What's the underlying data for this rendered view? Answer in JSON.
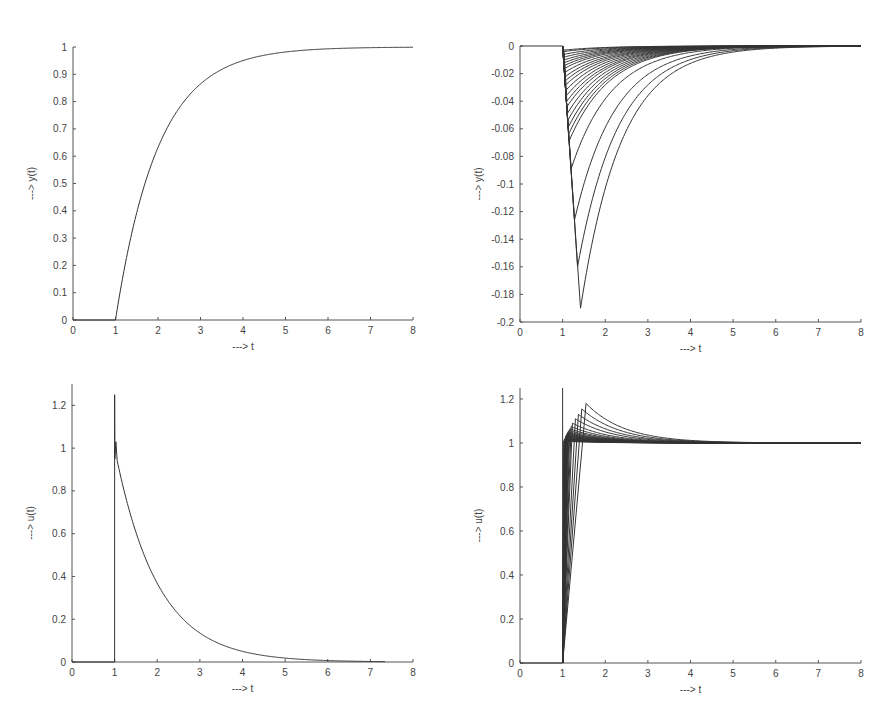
{
  "figure": {
    "layout": "2x2 subplots",
    "background": "#ffffff",
    "line_color": "#333333"
  },
  "chart_data": [
    {
      "id": "top-left",
      "type": "line",
      "title": "",
      "xlabel": "---> t",
      "ylabel": "---> y(t)",
      "xlim": [
        0,
        8
      ],
      "ylim": [
        0,
        1
      ],
      "xticks": [
        "0",
        "1",
        "2",
        "3",
        "4",
        "5",
        "6",
        "7",
        "8"
      ],
      "yticks": [
        "0",
        "0.1",
        "0.2",
        "0.3",
        "0.4",
        "0.5",
        "0.6",
        "0.7",
        "0.8",
        "0.9",
        "1"
      ],
      "grid": false,
      "legend": null,
      "pixel_box": {
        "x0": 73,
        "x1": 413,
        "y_top": 47,
        "y_bottom": 320
      },
      "model": {
        "kind": "step",
        "delay": 1,
        "tau": 1,
        "gain": 1
      },
      "series": [
        {
          "name": "y(t)",
          "x": [
            0,
            1,
            1.5,
            2,
            2.5,
            3,
            4,
            5,
            6,
            7,
            8
          ],
          "values": [
            0,
            0,
            0.39,
            0.63,
            0.78,
            0.86,
            0.95,
            0.98,
            0.99,
            1.0,
            1.0
          ]
        }
      ]
    },
    {
      "id": "top-right",
      "type": "line",
      "title": "",
      "xlabel": "---> t",
      "ylabel": "---> y(t)",
      "xlim": [
        0,
        8
      ],
      "ylim": [
        -0.2,
        0
      ],
      "xticks": [
        "0",
        "1",
        "2",
        "3",
        "4",
        "5",
        "6",
        "7",
        "8"
      ],
      "yticks": [
        "-0.2",
        "-0.18",
        "-0.16",
        "-0.14",
        "-0.12",
        "-0.1",
        "-0.08",
        "-0.06",
        "-0.04",
        "-0.02",
        "0"
      ],
      "grid": false,
      "legend": null,
      "pixel_box": {
        "x0": 520,
        "x1": 861,
        "y_top": 46,
        "y_bottom": 322
      },
      "model": {
        "kind": "undershoot-family",
        "delay": 1,
        "tau": 1
      },
      "series_summary": "Family of ~25 curves; each drops from 0 at t=1 to a minimum near t=1.05-1.42, then decays back to 0 by t≈7",
      "series": [
        {
          "name": "curve-1",
          "peak_t": 1.42,
          "peak_y": -0.19
        },
        {
          "name": "curve-2",
          "peak_t": 1.35,
          "peak_y": -0.16
        },
        {
          "name": "curve-3",
          "peak_t": 1.28,
          "peak_y": -0.126
        },
        {
          "name": "curve-4",
          "peak_t": 1.2,
          "peak_y": -0.089
        },
        {
          "name": "curve-5",
          "peak_t": 1.15,
          "peak_y": -0.069
        },
        {
          "name": "curve-6",
          "peak_t": 1.14,
          "peak_y": -0.064
        },
        {
          "name": "curve-7",
          "peak_t": 1.13,
          "peak_y": -0.059
        },
        {
          "name": "curve-8",
          "peak_t": 1.12,
          "peak_y": -0.054
        },
        {
          "name": "curve-9",
          "peak_t": 1.11,
          "peak_y": -0.049
        },
        {
          "name": "curve-10",
          "peak_t": 1.1,
          "peak_y": -0.044
        },
        {
          "name": "curve-11",
          "peak_t": 1.1,
          "peak_y": -0.04
        },
        {
          "name": "curve-12",
          "peak_t": 1.09,
          "peak_y": -0.036
        },
        {
          "name": "curve-13",
          "peak_t": 1.08,
          "peak_y": -0.032
        },
        {
          "name": "curve-14",
          "peak_t": 1.08,
          "peak_y": -0.028
        },
        {
          "name": "curve-15",
          "peak_t": 1.07,
          "peak_y": -0.025
        },
        {
          "name": "curve-16",
          "peak_t": 1.07,
          "peak_y": -0.022
        },
        {
          "name": "curve-17",
          "peak_t": 1.06,
          "peak_y": -0.019
        },
        {
          "name": "curve-18",
          "peak_t": 1.06,
          "peak_y": -0.016
        },
        {
          "name": "curve-19",
          "peak_t": 1.05,
          "peak_y": -0.014
        },
        {
          "name": "curve-20",
          "peak_t": 1.05,
          "peak_y": -0.012
        },
        {
          "name": "curve-21",
          "peak_t": 1.05,
          "peak_y": -0.01
        },
        {
          "name": "curve-22",
          "peak_t": 1.04,
          "peak_y": -0.008
        },
        {
          "name": "curve-23",
          "peak_t": 1.04,
          "peak_y": -0.006
        },
        {
          "name": "curve-24",
          "peak_t": 1.03,
          "peak_y": -0.004
        },
        {
          "name": "curve-25",
          "peak_t": 1.03,
          "peak_y": -0.003
        }
      ]
    },
    {
      "id": "bottom-left",
      "type": "line",
      "title": "",
      "xlabel": "---> t",
      "ylabel": "---> u(t)",
      "xlim": [
        0,
        8
      ],
      "ylim": [
        0,
        1.3
      ],
      "xticks": [
        "0",
        "1",
        "2",
        "3",
        "4",
        "5",
        "6",
        "7",
        "8"
      ],
      "yticks": [
        "0",
        "0.2",
        "0.4",
        "0.6",
        "0.8",
        "1",
        "1.2"
      ],
      "grid": false,
      "legend": null,
      "pixel_box": {
        "x0": 72,
        "x1": 413,
        "y_zero": 662,
        "y_one": 449
      },
      "model": {
        "kind": "decay",
        "delay": 1,
        "tau": 1,
        "spike": 1.25
      },
      "series": [
        {
          "name": "u(t)",
          "x": [
            0,
            1,
            1,
            1.05,
            1.5,
            2,
            2.5,
            3,
            4,
            5,
            6,
            7.3
          ],
          "values": [
            0,
            0,
            1.25,
            0.97,
            0.6,
            0.37,
            0.22,
            0.135,
            0.05,
            0.018,
            0.007,
            0.0
          ]
        }
      ]
    },
    {
      "id": "bottom-right",
      "type": "line",
      "title": "",
      "xlabel": "---> t",
      "ylabel": "---> u(t)",
      "xlim": [
        0,
        8
      ],
      "ylim": [
        0,
        1.25
      ],
      "xticks": [
        "0",
        "1",
        "2",
        "3",
        "4",
        "5",
        "6",
        "7",
        "8"
      ],
      "yticks": [
        "0",
        "0.2",
        "0.4",
        "0.6",
        "0.8",
        "1",
        "1.2"
      ],
      "grid": false,
      "legend": null,
      "pixel_box": {
        "x0": 520,
        "x1": 861,
        "y_zero": 663,
        "y_one": 443
      },
      "model": {
        "kind": "overshoot-family",
        "delay": 1,
        "settle": 1,
        "spike": 1.25
      },
      "series_summary": "Family of ~25 curves; each ramps from 0 at t=1 to a peak above 1 at t=1.03-1.55, then decays to 1 by t≈5",
      "series": [
        {
          "name": "curve-1",
          "peak_t": 1.55,
          "peak_y": 1.18
        },
        {
          "name": "curve-2",
          "peak_t": 1.45,
          "peak_y": 1.155
        },
        {
          "name": "curve-3",
          "peak_t": 1.37,
          "peak_y": 1.13
        },
        {
          "name": "curve-4",
          "peak_t": 1.3,
          "peak_y": 1.11
        },
        {
          "name": "curve-5",
          "peak_t": 1.23,
          "peak_y": 1.09
        },
        {
          "name": "curve-6",
          "peak_t": 1.2,
          "peak_y": 1.075
        },
        {
          "name": "curve-7",
          "peak_t": 1.17,
          "peak_y": 1.065
        },
        {
          "name": "curve-8",
          "peak_t": 1.15,
          "peak_y": 1.058
        },
        {
          "name": "curve-9",
          "peak_t": 1.13,
          "peak_y": 1.052
        },
        {
          "name": "curve-10",
          "peak_t": 1.12,
          "peak_y": 1.048
        },
        {
          "name": "curve-11",
          "peak_t": 1.11,
          "peak_y": 1.044
        },
        {
          "name": "curve-12",
          "peak_t": 1.1,
          "peak_y": 1.04
        },
        {
          "name": "curve-13",
          "peak_t": 1.09,
          "peak_y": 1.037
        },
        {
          "name": "curve-14",
          "peak_t": 1.08,
          "peak_y": 1.034
        },
        {
          "name": "curve-15",
          "peak_t": 1.08,
          "peak_y": 1.031
        },
        {
          "name": "curve-16",
          "peak_t": 1.07,
          "peak_y": 1.028
        },
        {
          "name": "curve-17",
          "peak_t": 1.07,
          "peak_y": 1.025
        },
        {
          "name": "curve-18",
          "peak_t": 1.06,
          "peak_y": 1.022
        },
        {
          "name": "curve-19",
          "peak_t": 1.06,
          "peak_y": 1.02
        },
        {
          "name": "curve-20",
          "peak_t": 1.05,
          "peak_y": 1.018
        },
        {
          "name": "curve-21",
          "peak_t": 1.05,
          "peak_y": 1.016
        },
        {
          "name": "curve-22",
          "peak_t": 1.04,
          "peak_y": 1.014
        },
        {
          "name": "curve-23",
          "peak_t": 1.04,
          "peak_y": 1.012
        },
        {
          "name": "curve-24",
          "peak_t": 1.03,
          "peak_y": 1.01
        },
        {
          "name": "curve-25",
          "peak_t": 1.03,
          "peak_y": 1.008
        }
      ]
    }
  ]
}
